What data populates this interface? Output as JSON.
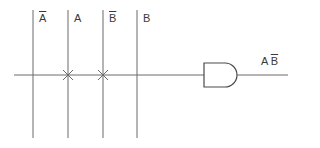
{
  "diagram": {
    "type": "PLA-style AND gate wiring",
    "colors": {
      "line": "#6a6a6a",
      "text": "#3a3a3a",
      "background": "#ffffff"
    },
    "input_columns": [
      {
        "label": "A",
        "inverted": true,
        "x": 33
      },
      {
        "label": "A",
        "inverted": false,
        "x": 68
      },
      {
        "label": "B",
        "inverted": true,
        "x": 103
      },
      {
        "label": "B",
        "inverted": false,
        "x": 137
      }
    ],
    "connections": [
      {
        "column": 1,
        "label": "A",
        "mark": "x"
      },
      {
        "column": 2,
        "label": "B̄",
        "mark": "x"
      }
    ],
    "gate": {
      "type": "AND",
      "output_label_part1": "A",
      "output_label_part2": "B"
    }
  }
}
